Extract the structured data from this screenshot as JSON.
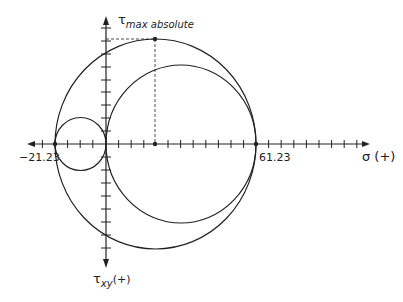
{
  "diagram": {
    "type": "mohr-circle",
    "labels": {
      "tau_max": "τ",
      "tau_max_sub": "max absolute",
      "sigma_axis": "σ (+)",
      "tau_axis": "τ",
      "tau_axis_sub": "xy",
      "tau_axis_suffix": "(+)",
      "left_value": "−21.23",
      "right_value": "61.23"
    },
    "values": {
      "sigma_min": -21.23,
      "sigma_max": 61.23
    },
    "circles": [
      {
        "name": "outer-circle",
        "from": -21.23,
        "to": 61.23
      },
      {
        "name": "right-circle",
        "from": 0,
        "to": 61.23
      },
      {
        "name": "left-circle",
        "from": -21.23,
        "to": 0
      }
    ],
    "colors": {
      "stroke": "#222222",
      "background": "#ffffff"
    }
  }
}
